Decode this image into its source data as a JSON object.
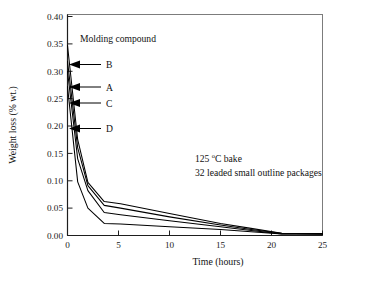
{
  "chart_data": {
    "type": "line",
    "title": "",
    "xlabel": "Time (hours)",
    "ylabel": "Weight loss (% wt.)",
    "xlim": [
      0,
      25
    ],
    "ylim": [
      0,
      0.4
    ],
    "xticks": [
      0,
      5,
      10,
      15,
      20,
      25
    ],
    "xtick_labels": [
      "0",
      "5",
      "10",
      "15",
      "20",
      "25"
    ],
    "yticks": [
      0.0,
      0.05,
      0.1,
      0.15,
      0.2,
      0.25,
      0.3,
      0.35,
      0.4
    ],
    "ytick_labels": [
      "0.00",
      "0.05",
      "0.10",
      "0.15",
      "0.20",
      "0.25",
      "0.30",
      "0.35",
      "0.40"
    ],
    "grid": false,
    "legend": "inline-arrow-labels",
    "legend_title": "Molding compound",
    "annotations": [
      "125 °C bake",
      "32 leaded small outline packages"
    ],
    "annotation_line1_pre": "125 ",
    "annotation_line1_sup": "o",
    "annotation_line1_post": "C bake",
    "annotation_line2": "32 leaded small outline packages",
    "series": [
      {
        "name": "B",
        "x": [
          0,
          1.0,
          2.0,
          3.6,
          5.2,
          10.0,
          15.0,
          18.0,
          21.0,
          25.0
        ],
        "y": [
          0.347,
          0.175,
          0.097,
          0.062,
          0.058,
          0.04,
          0.022,
          0.013,
          0.004,
          0.003
        ]
      },
      {
        "name": "A",
        "x": [
          0,
          1.0,
          2.0,
          3.6,
          5.2,
          10.0,
          15.0,
          18.0,
          21.0,
          25.0
        ],
        "y": [
          0.318,
          0.16,
          0.091,
          0.055,
          0.05,
          0.034,
          0.019,
          0.011,
          0.004,
          0.003
        ]
      },
      {
        "name": "C",
        "x": [
          0,
          1.0,
          2.0,
          3.6,
          5.2,
          10.0,
          15.0,
          18.0,
          21.0,
          25.0
        ],
        "y": [
          0.3,
          0.14,
          0.082,
          0.042,
          0.038,
          0.027,
          0.016,
          0.009,
          0.003,
          0.003
        ]
      },
      {
        "name": "D",
        "x": [
          0,
          1.0,
          2.0,
          3.6,
          5.2,
          10.0,
          15.0,
          18.0,
          21.0,
          25.0
        ],
        "y": [
          0.272,
          0.098,
          0.05,
          0.022,
          0.021,
          0.016,
          0.011,
          0.007,
          0.003,
          0.003
        ]
      }
    ],
    "series_labels": [
      {
        "name": "B",
        "label": "B",
        "y_at_label": 0.313
      },
      {
        "name": "A",
        "label": "A",
        "y_at_label": 0.272
      },
      {
        "name": "C",
        "label": "C",
        "y_at_label": 0.243
      },
      {
        "name": "D",
        "label": "D",
        "y_at_label": 0.197
      }
    ]
  }
}
